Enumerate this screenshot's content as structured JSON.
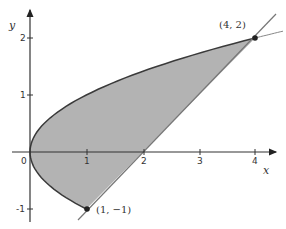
{
  "diagram": {
    "type": "region-between-curves",
    "curves": [
      {
        "name": "parabola",
        "equation": "x = y^2",
        "color": "#3a3a3a"
      },
      {
        "name": "line",
        "equation": "y = x - 2",
        "color": "#777777"
      }
    ],
    "region_fill": "#b3b3b3",
    "axes": {
      "x_label": "x",
      "y_label": "y",
      "x_ticks": [
        {
          "value": 0,
          "label": "0"
        },
        {
          "value": 1,
          "label": "1"
        },
        {
          "value": 2,
          "label": "2"
        },
        {
          "value": 3,
          "label": "3"
        },
        {
          "value": 4,
          "label": "4"
        }
      ],
      "y_ticks": [
        {
          "value": 2,
          "label": "2"
        },
        {
          "value": 1,
          "label": "1"
        },
        {
          "value": -1,
          "label": "-1"
        }
      ]
    },
    "points": [
      {
        "label": "(4, 2)",
        "x": 4,
        "y": 2
      },
      {
        "label": "(1, −1)",
        "x": 1,
        "y": -1
      }
    ]
  }
}
